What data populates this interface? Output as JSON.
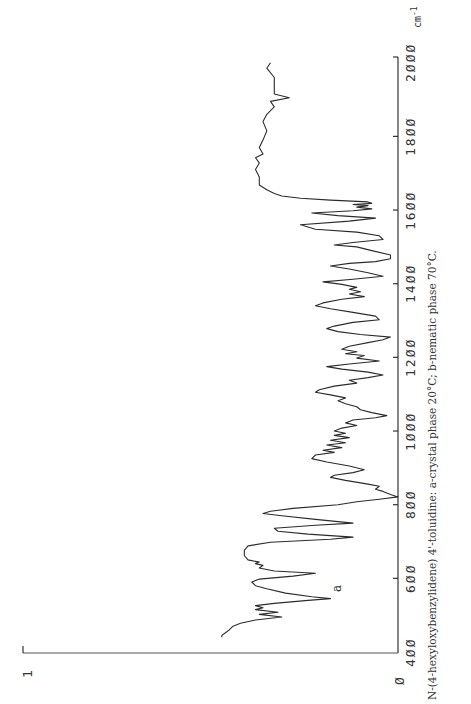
{
  "page": {
    "caption": "N-(4-hexyloxybenzylidene) 4'-toluidine: a-crystal phase 20°C; b-nematic phase 70°C.",
    "series_label": "a",
    "unit_label": "cm",
    "unit_exp": "-1"
  },
  "chart_data": {
    "type": "line",
    "title": "N-(4-hexyloxybenzylidene) 4'-toluidine: a-crystal phase 20°C; b-nematic phase 70°C.",
    "xlabel": "Wavenumber (cm-1)",
    "ylabel": "Transmittance",
    "xlim": [
      400,
      2000
    ],
    "ylim": [
      0,
      1
    ],
    "orientation": "rotated 90° (wavenumber axis vertical, transmittance axis horizontal)",
    "x_ticks": [
      400,
      600,
      800,
      1000,
      1200,
      1400,
      1600,
      1800,
      2000
    ],
    "x_tick_labels": [
      "400",
      "600",
      "800",
      "1000",
      "1200",
      "1400",
      "1600",
      "1800",
      "2000"
    ],
    "y_ticks": [
      0,
      1
    ],
    "y_tick_labels": [
      "0",
      "1"
    ],
    "grid": false,
    "legend": [],
    "series": [
      {
        "name": "a",
        "points": [
          [
            2000,
            0.34
          ],
          [
            1985,
            0.35
          ],
          [
            1960,
            0.33
          ],
          [
            1935,
            0.33
          ],
          [
            1915,
            0.33
          ],
          [
            1905,
            0.29
          ],
          [
            1895,
            0.34
          ],
          [
            1880,
            0.33
          ],
          [
            1860,
            0.35
          ],
          [
            1840,
            0.36
          ],
          [
            1815,
            0.35
          ],
          [
            1790,
            0.36
          ],
          [
            1770,
            0.37
          ],
          [
            1752,
            0.36
          ],
          [
            1742,
            0.38
          ],
          [
            1728,
            0.37
          ],
          [
            1710,
            0.38
          ],
          [
            1690,
            0.37
          ],
          [
            1668,
            0.37
          ],
          [
            1655,
            0.35
          ],
          [
            1645,
            0.33
          ],
          [
            1638,
            0.31
          ],
          [
            1632,
            0.26
          ],
          [
            1627,
            0.18
          ],
          [
            1622,
            0.08
          ],
          [
            1618,
            0.07
          ],
          [
            1615,
            0.12
          ],
          [
            1612,
            0.08
          ],
          [
            1608,
            0.11
          ],
          [
            1603,
            0.07
          ],
          [
            1598,
            0.12
          ],
          [
            1592,
            0.23
          ],
          [
            1585,
            0.16
          ],
          [
            1578,
            0.06
          ],
          [
            1570,
            0.13
          ],
          [
            1560,
            0.26
          ],
          [
            1548,
            0.22
          ],
          [
            1540,
            0.11
          ],
          [
            1530,
            0.05
          ],
          [
            1520,
            0.04
          ],
          [
            1512,
            0.12
          ],
          [
            1505,
            0.17
          ],
          [
            1500,
            0.11
          ],
          [
            1490,
            0.07
          ],
          [
            1478,
            0.02
          ],
          [
            1468,
            0.02
          ],
          [
            1460,
            0.06
          ],
          [
            1455,
            0.13
          ],
          [
            1448,
            0.18
          ],
          [
            1440,
            0.13
          ],
          [
            1430,
            0.08
          ],
          [
            1420,
            0.04
          ],
          [
            1412,
            0.12
          ],
          [
            1405,
            0.2
          ],
          [
            1398,
            0.15
          ],
          [
            1390,
            0.11
          ],
          [
            1385,
            0.13
          ],
          [
            1378,
            0.1
          ],
          [
            1372,
            0.13
          ],
          [
            1365,
            0.09
          ],
          [
            1358,
            0.15
          ],
          [
            1348,
            0.2
          ],
          [
            1340,
            0.22
          ],
          [
            1332,
            0.18
          ],
          [
            1322,
            0.12
          ],
          [
            1312,
            0.06
          ],
          [
            1302,
            0.05
          ],
          [
            1295,
            0.12
          ],
          [
            1285,
            0.17
          ],
          [
            1278,
            0.19
          ],
          [
            1270,
            0.16
          ],
          [
            1262,
            0.1
          ],
          [
            1255,
            0.02
          ],
          [
            1248,
            0.04
          ],
          [
            1240,
            0.08
          ],
          [
            1230,
            0.13
          ],
          [
            1222,
            0.15
          ],
          [
            1215,
            0.11
          ],
          [
            1210,
            0.14
          ],
          [
            1205,
            0.09
          ],
          [
            1198,
            0.11
          ],
          [
            1190,
            0.05
          ],
          [
            1182,
            0.13
          ],
          [
            1175,
            0.19
          ],
          [
            1168,
            0.15
          ],
          [
            1160,
            0.08
          ],
          [
            1152,
            0.04
          ],
          [
            1145,
            0.08
          ],
          [
            1138,
            0.13
          ],
          [
            1130,
            0.11
          ],
          [
            1122,
            0.17
          ],
          [
            1112,
            0.21
          ],
          [
            1105,
            0.22
          ],
          [
            1098,
            0.18
          ],
          [
            1090,
            0.14
          ],
          [
            1082,
            0.16
          ],
          [
            1074,
            0.14
          ],
          [
            1066,
            0.11
          ],
          [
            1058,
            0.1
          ],
          [
            1050,
            0.07
          ],
          [
            1042,
            0.03
          ],
          [
            1036,
            0.06
          ],
          [
            1030,
            0.12
          ],
          [
            1022,
            0.14
          ],
          [
            1015,
            0.11
          ],
          [
            1008,
            0.15
          ],
          [
            1000,
            0.17
          ],
          [
            994,
            0.14
          ],
          [
            988,
            0.17
          ],
          [
            982,
            0.13
          ],
          [
            975,
            0.18
          ],
          [
            968,
            0.14
          ],
          [
            962,
            0.19
          ],
          [
            955,
            0.15
          ],
          [
            948,
            0.2
          ],
          [
            942,
            0.17
          ],
          [
            935,
            0.22
          ],
          [
            925,
            0.23
          ],
          [
            916,
            0.19
          ],
          [
            905,
            0.13
          ],
          [
            895,
            0.09
          ],
          [
            887,
            0.12
          ],
          [
            880,
            0.17
          ],
          [
            874,
            0.18
          ],
          [
            866,
            0.14
          ],
          [
            856,
            0.08
          ],
          [
            850,
            0.05
          ],
          [
            842,
            0.06
          ],
          [
            836,
            0.04
          ],
          [
            828,
            0.02
          ],
          [
            821,
            0.0
          ],
          [
            815,
            0.05
          ],
          [
            808,
            0.11
          ],
          [
            800,
            0.16
          ],
          [
            790,
            0.28
          ],
          [
            782,
            0.34
          ],
          [
            776,
            0.36
          ],
          [
            770,
            0.31
          ],
          [
            760,
            0.22
          ],
          [
            750,
            0.12
          ],
          [
            744,
            0.22
          ],
          [
            736,
            0.33
          ],
          [
            728,
            0.32
          ],
          [
            720,
            0.24
          ],
          [
            712,
            0.12
          ],
          [
            706,
            0.18
          ],
          [
            698,
            0.34
          ],
          [
            688,
            0.4
          ],
          [
            676,
            0.41
          ],
          [
            662,
            0.41
          ],
          [
            650,
            0.4
          ],
          [
            644,
            0.37
          ],
          [
            640,
            0.38
          ],
          [
            635,
            0.36
          ],
          [
            628,
            0.37
          ],
          [
            620,
            0.33
          ],
          [
            614,
            0.22
          ],
          [
            606,
            0.28
          ],
          [
            598,
            0.37
          ],
          [
            590,
            0.39
          ],
          [
            580,
            0.38
          ],
          [
            572,
            0.35
          ],
          [
            560,
            0.3
          ],
          [
            550,
            0.23
          ],
          [
            545,
            0.18
          ],
          [
            540,
            0.24
          ],
          [
            532,
            0.33
          ],
          [
            526,
            0.38
          ],
          [
            520,
            0.36
          ],
          [
            515,
            0.38
          ],
          [
            508,
            0.32
          ],
          [
            502,
            0.37
          ],
          [
            495,
            0.31
          ],
          [
            487,
            0.38
          ],
          [
            478,
            0.42
          ],
          [
            470,
            0.44
          ],
          [
            460,
            0.45
          ],
          [
            452,
            0.46
          ],
          [
            445,
            0.47
          ],
          [
            440,
            0.47
          ]
        ]
      }
    ]
  }
}
